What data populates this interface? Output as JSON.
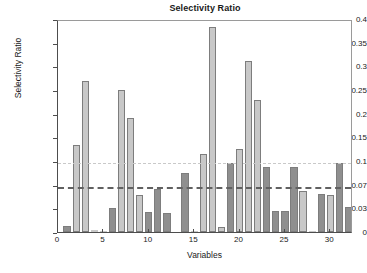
{
  "chart_data": {
    "type": "bar",
    "title": "Selectivity Ratio",
    "xlabel": "Variables",
    "ylabel": "Selectivity Ratio",
    "xlim": [
      0,
      32.5
    ],
    "ylim": [
      0,
      0.4
    ],
    "grid": false,
    "legend": null,
    "y_scale": "piecewise-linear",
    "xticks": [
      0,
      5,
      10,
      15,
      20,
      25,
      30
    ],
    "xtick_labels": [
      "0",
      "5",
      "10",
      "15",
      "20",
      "25",
      "30"
    ],
    "yticks": [
      0,
      0.03,
      0.07,
      0.1,
      0.15,
      0.2,
      0.25,
      0.3,
      0.35,
      0.4
    ],
    "ytick_labels": [
      "0",
      "0.03",
      "0.07",
      "0.1",
      "0.15",
      "0.2",
      "0.25",
      "0.3",
      "0.35",
      "0.4"
    ],
    "reference_lines": [
      {
        "name": "upper-threshold",
        "value": 0.1,
        "style": "dotted",
        "color": "#c9c9c9"
      },
      {
        "name": "lower-threshold",
        "value": 0.07,
        "style": "dashed",
        "color": "#606060"
      }
    ],
    "colors": {
      "light": "#c8c8c8",
      "dark": "#8f8f8f",
      "edge": "#7d7d7d"
    },
    "categories": [
      1,
      2,
      3,
      4,
      5,
      6,
      7,
      8,
      9,
      10,
      11,
      12,
      13,
      14,
      15,
      16,
      17,
      18,
      19,
      20,
      21,
      22,
      23,
      24,
      25,
      26,
      27,
      28,
      29,
      30,
      31,
      32
    ],
    "values": [
      0.008,
      0.133,
      0.27,
      0.002,
      0.001,
      0.03,
      0.251,
      0.19,
      0.052,
      0.025,
      0.063,
      0.024,
      0.0,
      0.085,
      0.001,
      0.115,
      0.383,
      0.006,
      0.097,
      0.126,
      0.311,
      0.228,
      0.093,
      0.027,
      0.027,
      0.093,
      0.06,
      0.001,
      0.055,
      0.052,
      0.097,
      0.033
    ],
    "bar_shades": [
      "dark",
      "light",
      "light",
      "light",
      "light",
      "dark",
      "light",
      "light",
      "light",
      "dark",
      "dark",
      "dark",
      "light",
      "dark",
      "light",
      "light",
      "light",
      "light",
      "dark",
      "light",
      "light",
      "light",
      "dark",
      "dark",
      "dark",
      "dark",
      "light",
      "light",
      "dark",
      "light",
      "dark",
      "dark"
    ]
  }
}
